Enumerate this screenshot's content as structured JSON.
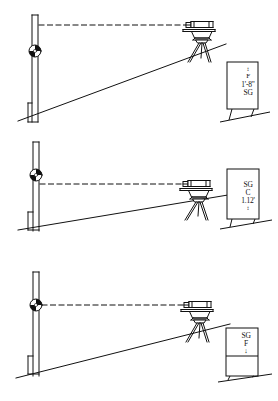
{
  "figure": {
    "type": "surveying-diagram",
    "panel_count": 3,
    "ink_color": "#111111",
    "background_color": "#ffffff"
  },
  "panels": [
    {
      "id": "panel-top",
      "name": "backsight-setup",
      "rod": {
        "name": "leveling-rod",
        "target_label": "bullseye-target",
        "target_position": "mid-rod"
      },
      "sight_line": {
        "name": "line-of-sight",
        "style": "dashed",
        "direction": "horizontal"
      },
      "instrument": {
        "name": "surveyors-level-on-tripod",
        "legs": 3
      },
      "ground": {
        "name": "ground-slope-line",
        "description": "rising slope left to right"
      },
      "placard": {
        "name": "grade-stake-card",
        "lines": [
          {
            "key": "arrow",
            "text": "↕"
          },
          {
            "key": "mark",
            "text": "F"
          },
          {
            "key": "offset",
            "text": "1'-8\""
          },
          {
            "key": "grade",
            "text": "SG"
          }
        ]
      }
    },
    {
      "id": "panel-middle",
      "name": "intermediate-sight-setup",
      "rod": {
        "name": "leveling-rod",
        "target_label": "bullseye-target",
        "target_position": "upper-rod"
      },
      "sight_line": {
        "name": "line-of-sight",
        "style": "dashed",
        "direction": "horizontal"
      },
      "instrument": {
        "name": "surveyors-level-on-tripod",
        "legs": 3
      },
      "ground": {
        "name": "ground-slope-line",
        "description": "rising slope left to right"
      },
      "placard": {
        "name": "grade-stake-card",
        "lines": [
          {
            "key": "grade",
            "text": "SG"
          },
          {
            "key": "mark",
            "text": "C"
          },
          {
            "key": "offset",
            "text": "1.12'"
          },
          {
            "key": "arrow",
            "text": "↕"
          }
        ]
      }
    },
    {
      "id": "panel-bottom",
      "name": "foresight-setup",
      "rod": {
        "name": "leveling-rod",
        "target_label": "bullseye-target",
        "target_position": "upper-rod"
      },
      "sight_line": {
        "name": "line-of-sight",
        "style": "dashed",
        "direction": "horizontal"
      },
      "instrument": {
        "name": "surveyors-level-on-tripod",
        "legs": 3
      },
      "ground": {
        "name": "ground-slope-line",
        "description": "rising slope left to right"
      },
      "placard": {
        "name": "grade-stake-card",
        "lines": [
          {
            "key": "grade",
            "text": "SG"
          },
          {
            "key": "mark",
            "text": "F"
          },
          {
            "key": "arrow",
            "text": "↓"
          }
        ]
      }
    }
  ]
}
